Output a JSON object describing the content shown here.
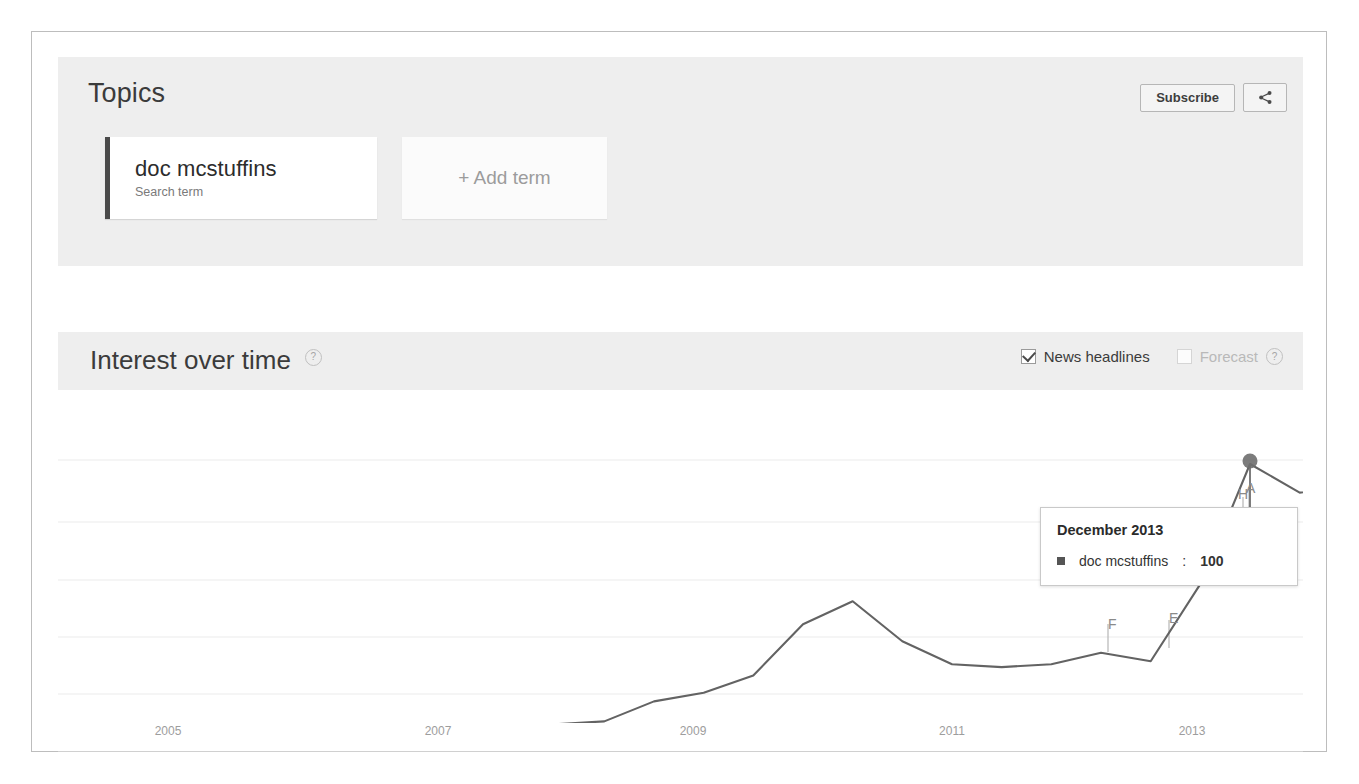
{
  "app": {
    "name": "Google Trends"
  },
  "topics": {
    "title": "Topics",
    "subscribe_label": "Subscribe",
    "share_icon": "share-icon",
    "terms": [
      {
        "name": "doc mcstuffins",
        "type_label": "Search term",
        "accent_color": "#4a4a4a"
      }
    ],
    "add_term_label": "+ Add term"
  },
  "interest_over_time": {
    "title": "Interest over time",
    "help_label": "?",
    "controls": {
      "news_headlines": {
        "label": "News headlines",
        "checked": true,
        "enabled": true
      },
      "forecast": {
        "label": "Forecast",
        "checked": false,
        "enabled": false,
        "help_label": "?"
      }
    }
  },
  "tooltip": {
    "date": "December 2013",
    "series_name": "doc mcstuffins",
    "separator": ": ",
    "value": "100",
    "swatch_color": "#555555"
  },
  "news_markers": [
    {
      "label": "F",
      "x": 1076,
      "y": 592
    },
    {
      "label": "E",
      "x": 1137,
      "y": 588
    },
    {
      "label": "A",
      "x": 1217,
      "y": 455
    },
    {
      "label": "H",
      "x": 1211,
      "y": 465
    }
  ],
  "chart_data": {
    "type": "line",
    "title": "Interest over time",
    "xlabel": "",
    "ylabel": "",
    "ylim": [
      0,
      100
    ],
    "grid": true,
    "legend": false,
    "series_name": "doc mcstuffins",
    "line_color": "#636363",
    "tick_labels": [
      "2005",
      "2007",
      "2009",
      "2011",
      "2013"
    ],
    "tick_x": [
      136,
      406,
      661,
      920,
      1160
    ],
    "gridline_y": [
      428,
      490,
      548,
      605,
      662
    ],
    "baseline_y": 718,
    "highlight": {
      "date": "December 2013",
      "value": 100,
      "x": 1218,
      "y": 432
    },
    "x": [
      "2004-01",
      "2005-01",
      "2006-01",
      "2007-01",
      "2008-01",
      "2009-01",
      "2010-01",
      "2011-01",
      "2012-01",
      "2012-03",
      "2012-05",
      "2012-07",
      "2012-09",
      "2012-11",
      "2013-01",
      "2013-03",
      "2013-04",
      "2013-05",
      "2013-06",
      "2013-07",
      "2013-08",
      "2013-09",
      "2013-10",
      "2013-11",
      "2013-12",
      "2014-01",
      "2014-02",
      "2014-03",
      "2014-04",
      "2014-05",
      "2014-06",
      "2014-07",
      "2014-08"
    ],
    "values": [
      0,
      0,
      0,
      0,
      0,
      0,
      0,
      0,
      0,
      4,
      9,
      10,
      17,
      20,
      26,
      44,
      52,
      38,
      30,
      29,
      30,
      34,
      31,
      58,
      100,
      90,
      92,
      72,
      78,
      50,
      43,
      55,
      62
    ]
  }
}
